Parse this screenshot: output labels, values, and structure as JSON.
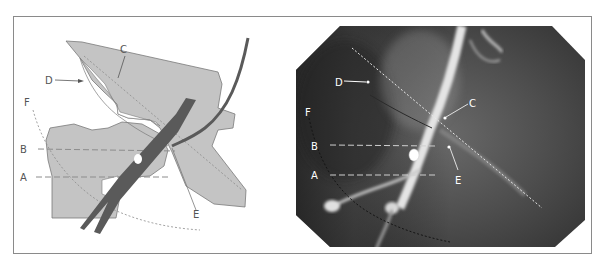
{
  "figure": {
    "panels": [
      {
        "id": "schematic",
        "type": "anatomical-drawing",
        "labels": {
          "A": "A",
          "B": "B",
          "C": "C",
          "D": "D",
          "E": "E",
          "F": "F"
        }
      },
      {
        "id": "angiogram",
        "type": "fluoroscopy-image",
        "labels": {
          "A": "A",
          "B": "B",
          "C": "C",
          "D": "D",
          "E": "E",
          "F": "F"
        }
      }
    ]
  },
  "colors": {
    "frame": "#8a8a8a",
    "bone": "#c4c4c4",
    "bone_outline": "#7a7a7a",
    "vessel": "#5a5a5a",
    "dashed_line": "#8c8c8c",
    "xray_dark": "#3a3a3a",
    "xray_light": "#e8e8e8"
  }
}
